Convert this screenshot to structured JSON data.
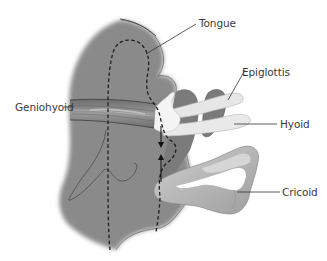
{
  "diagram": {
    "type": "anatomical-illustration",
    "colors": {
      "tissue": "#8a8a8a",
      "tissue_dark": "#6f6f6f",
      "cartilage": "#b9b9b9",
      "cartilage_light": "#d8d8d8",
      "bone": "#eeeeee",
      "line": "#333333",
      "background": "#ffffff"
    }
  },
  "labels": {
    "tongue": "Tongue",
    "epiglottis": "Epiglottis",
    "geniohyoid": "Geniohyoid",
    "hyoid": "Hyoid",
    "cricoid": "Cricoid"
  },
  "annotations": {
    "arrows": "vertical double arrows indicating hyoid-to-cricoid displacement",
    "dashed_outline": "dashed contour of tongue / pharyngeal wall"
  }
}
